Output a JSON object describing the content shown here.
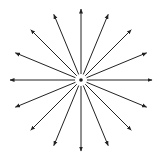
{
  "diagram": {
    "type": "radial-arrows",
    "center": {
      "x": 81,
      "y": 80
    },
    "ray_count": 16,
    "angle_step_deg": 22.5,
    "inner_radius": 6,
    "outer_radius": 71,
    "center_dot_radius": 1.8,
    "stroke_color": "#222222",
    "background": "#ffffff"
  }
}
